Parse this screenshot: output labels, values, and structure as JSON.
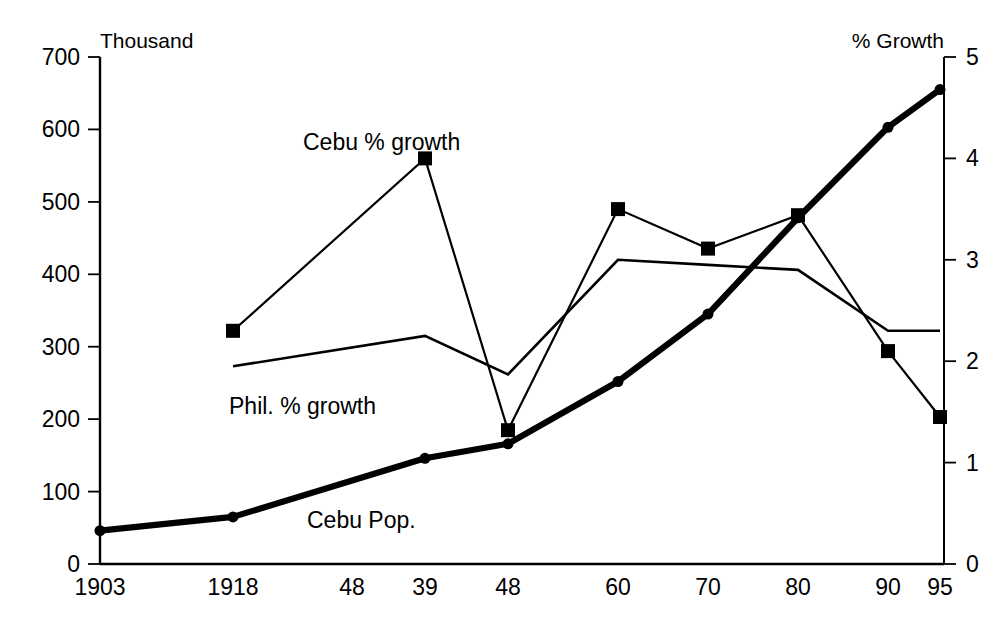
{
  "chart_data": {
    "type": "line",
    "title": "",
    "subtitle": "",
    "left_axis_label": "Thousand",
    "right_axis_label": "% Growth",
    "xlabel": "",
    "ylabel": "Thousand",
    "y2label": "% Growth",
    "grid": false,
    "legend_position": "inline-annotations",
    "categories": [
      "1903",
      "1918",
      "48",
      "39",
      "48",
      "60",
      "70",
      "80",
      "90",
      "95"
    ],
    "ylim": [
      0,
      700
    ],
    "yticks": [
      0,
      100,
      200,
      300,
      400,
      500,
      600,
      700
    ],
    "y2lim": [
      0,
      5
    ],
    "y2ticks": [
      0,
      1,
      2,
      3,
      4,
      5
    ],
    "series": [
      {
        "name": "Cebu Pop.",
        "axis": "left",
        "units": "thousand",
        "marker": "circle",
        "line_weight": "thick",
        "x": [
          "1903",
          "1918",
          "39",
          "48",
          "60",
          "70",
          "80",
          "90",
          "95"
        ],
        "values": [
          46,
          65,
          146,
          166,
          252,
          345,
          478,
          603,
          655
        ]
      },
      {
        "name": "Cebu % growth",
        "axis": "right",
        "units": "percent",
        "marker": "square",
        "line_weight": "thin",
        "x": [
          "1918",
          "39",
          "48",
          "60",
          "70",
          "80",
          "90",
          "95"
        ],
        "values": [
          2.3,
          4.0,
          1.32,
          3.5,
          3.11,
          3.44,
          2.1,
          1.45
        ]
      },
      {
        "name": "Phil. % growth",
        "axis": "right",
        "units": "percent",
        "marker": "none",
        "line_weight": "thin",
        "x": [
          "1918",
          "39",
          "48",
          "60",
          "70",
          "80",
          "90",
          "95"
        ],
        "values": [
          1.95,
          2.25,
          1.87,
          3.0,
          2.95,
          2.9,
          2.3,
          2.3
        ]
      }
    ],
    "annotations": [
      {
        "text": "Cebu % growth",
        "x_px": 303,
        "y_px": 150
      },
      {
        "text": "Phil. % growth",
        "x_px": 229,
        "y_px": 414
      },
      {
        "text": "Cebu Pop.",
        "x_px": 307,
        "y_px": 528
      }
    ]
  },
  "axis_titles": {
    "left": "Thousand",
    "right": "% Growth"
  },
  "left_ticks": {
    "t0": "0",
    "t1": "100",
    "t2": "200",
    "t3": "300",
    "t4": "400",
    "t5": "500",
    "t6": "600",
    "t7": "700"
  },
  "right_ticks": {
    "t0": "0",
    "t1": "1",
    "t2": "2",
    "t3": "3",
    "t4": "4",
    "t5": "5"
  },
  "x_ticks": {
    "t0": "1903",
    "t1": "1918",
    "t2": "48",
    "t3": "39",
    "t4": "48",
    "t5": "60",
    "t6": "70",
    "t7": "80",
    "t8": "90",
    "t9": "95"
  },
  "annotation_labels": {
    "cebu_growth": "Cebu % growth",
    "phil_growth": "Phil. % growth",
    "cebu_pop": "Cebu Pop."
  },
  "colors": {
    "ink": "#000000",
    "background": "#ffffff"
  }
}
